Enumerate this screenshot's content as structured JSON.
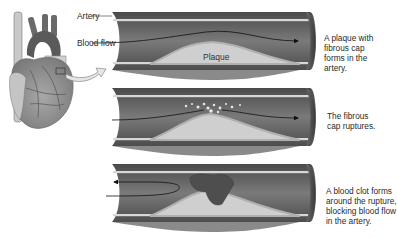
{
  "figure": {
    "colors": {
      "artery_wall": "#5e5e5e",
      "artery_lumen": "#6f6f6f",
      "inner_lining": "#d8d8d8",
      "plaque": "#cfcfcf",
      "fibrous_cap": "#b8b8b8",
      "clot": "#555555",
      "heart": "#9a9a9a",
      "arrow_fill": "#e6e6e6"
    },
    "labels": {
      "artery": "Artery",
      "blood_flow": "Blood flow",
      "plaque": "Plaque"
    },
    "stages": [
      {
        "id": "plaque-forms",
        "caption": [
          "A plaque with",
          "fibrous cap",
          "forms in the",
          "artery."
        ]
      },
      {
        "id": "cap-ruptures",
        "caption": [
          "The fibrous",
          "cap ruptures."
        ]
      },
      {
        "id": "clot-forms",
        "caption": [
          "A blood clot forms",
          "around the rupture,",
          "blocking blood flow",
          "in the artery."
        ]
      }
    ]
  }
}
